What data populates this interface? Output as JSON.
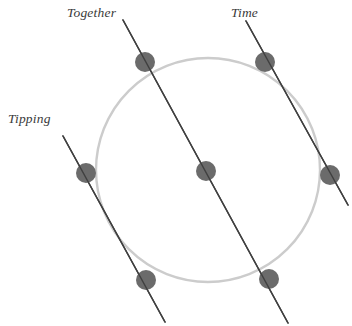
{
  "figure": {
    "width": 352,
    "height": 326,
    "background": "#ffffff"
  },
  "labels": [
    {
      "id": "together",
      "text": "Together",
      "x": 67,
      "y": 6
    },
    {
      "id": "time",
      "text": "Time",
      "x": 231,
      "y": 6
    },
    {
      "id": "tipping",
      "text": "Tipping",
      "x": 8,
      "y": 112
    }
  ],
  "colors": {
    "circle_stroke": "#cccccc",
    "line_stroke": "#404040",
    "dot_fill": "#6b6b6b",
    "label_text": "#3a3a3a",
    "background": "#ffffff"
  },
  "chart_data": {
    "type": "scatter",
    "title": "",
    "subtitle": "",
    "xlabel": "",
    "ylabel": "",
    "grid": false,
    "legend_position": "none",
    "xlim": [
      0,
      352
    ],
    "ylim": [
      0,
      326
    ],
    "annotations": [
      "Together",
      "Time",
      "Tipping"
    ],
    "circle": {
      "name": "reference-circle",
      "cx": 208,
      "cy": 170,
      "r": 112,
      "stroke": "#cccccc",
      "stroke_width": 2.4,
      "fill": "none"
    },
    "lines": [
      {
        "name": "together-axis",
        "label": "Together",
        "x1": 123,
        "y1": 20,
        "x2": 288,
        "y2": 323,
        "stroke": "#404040",
        "stroke_width": 1.5
      },
      {
        "name": "time-axis",
        "label": "Time",
        "x1": 246,
        "y1": 21,
        "x2": 348,
        "y2": 205,
        "stroke": "#404040",
        "stroke_width": 1.5
      },
      {
        "name": "tipping-axis",
        "label": "Tipping",
        "x1": 63,
        "y1": 136,
        "x2": 165,
        "y2": 322,
        "stroke": "#404040",
        "stroke_width": 1.5
      }
    ],
    "points": [
      {
        "name": "together-top-point",
        "x": 145,
        "y": 62,
        "r": 10
      },
      {
        "name": "together-center-point",
        "x": 206,
        "y": 171,
        "r": 10
      },
      {
        "name": "together-bottom-point",
        "x": 269,
        "y": 279,
        "r": 10
      },
      {
        "name": "time-top-point",
        "x": 265,
        "y": 62,
        "r": 10
      },
      {
        "name": "time-right-point",
        "x": 330,
        "y": 175,
        "r": 10
      },
      {
        "name": "tipping-top-point",
        "x": 86,
        "y": 173,
        "r": 10
      },
      {
        "name": "tipping-bottom-point",
        "x": 146,
        "y": 280,
        "r": 10
      }
    ]
  }
}
